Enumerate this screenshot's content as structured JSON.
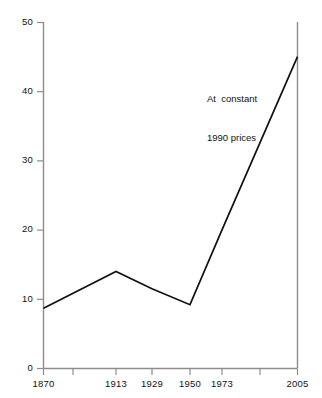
{
  "chart_data": {
    "type": "line",
    "title": "",
    "xlabel": "",
    "ylabel": "",
    "x": [
      1870,
      1913,
      1929,
      1950,
      1973,
      2005
    ],
    "categories": [
      "1870",
      "1913",
      "1929",
      "1950",
      "1973",
      "2005"
    ],
    "values": [
      8.7,
      14.0,
      11.5,
      9.2,
      20.0,
      45.0
    ],
    "series": [
      {
        "name": "At constant 1990 prices",
        "values": [
          8.7,
          14.0,
          11.5,
          9.2,
          20.0,
          45.0
        ]
      }
    ],
    "ylim": [
      0,
      50
    ],
    "yticks": [
      0,
      10,
      20,
      30,
      40,
      50
    ],
    "ytick_labels": [
      "0",
      "10",
      "20",
      "30",
      "40",
      "50"
    ],
    "xticks": [
      1870,
      1890,
      1913,
      1929,
      1950,
      1973,
      1990,
      2005
    ],
    "xtick_labels": [
      "1870",
      "",
      "1913",
      "1929",
      "1950",
      "1973",
      "",
      "2005"
    ],
    "grid": false,
    "legend": "none",
    "line_color": "#111111",
    "axis_color": "#8c8c8c",
    "background": "#ffffff",
    "annotations": [
      {
        "line1": "At  constant",
        "line2": "1990 prices"
      }
    ]
  },
  "axes": {
    "y": {
      "labels": [
        "50",
        "40",
        "30",
        "20",
        "10",
        "0"
      ]
    },
    "x": {
      "labels": [
        "1870",
        "1913",
        "1929",
        "1950",
        "1973",
        "2005"
      ]
    }
  },
  "annotation": {
    "line1": "At  constant",
    "line2": "1990 prices"
  }
}
